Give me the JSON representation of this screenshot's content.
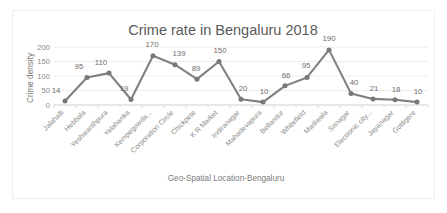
{
  "chart_data": {
    "type": "line",
    "title": "Crime rate in Bengaluru 2018",
    "xlabel": "Geo-Spatial Location-Bengaluru",
    "ylabel": "Crime density",
    "categories": [
      "Jalahalli",
      "Hebbala",
      "Yeshwanthpura",
      "Yelahanka",
      "Kempegowda...",
      "Corporation Circle",
      "Chickpete",
      "K R Market",
      "Indiranagar",
      "Mahadevapura",
      "Bellandur",
      "Whitefield",
      "Madiwala",
      "Srinagar",
      "Electronic city...",
      "Jayanagar",
      "Gottigere"
    ],
    "values": [
      14,
      95,
      110,
      19,
      170,
      139,
      89,
      150,
      20,
      10,
      66,
      95,
      190,
      40,
      21,
      18,
      10
    ],
    "data_labels": [
      "14",
      "95",
      "110",
      "19",
      "170",
      "139",
      "89",
      "150",
      "20",
      "10",
      "66",
      "95",
      "190",
      "40",
      "21",
      "18",
      "10"
    ],
    "ytick_labels": [
      "0",
      "50",
      "100",
      "150",
      "200"
    ],
    "ytick_values": [
      0,
      50,
      100,
      150,
      200
    ],
    "ylim": [
      0,
      200
    ],
    "grid": true,
    "legend": false,
    "series_color": "#808080",
    "marker": "circle",
    "marker_color": "#787878"
  },
  "styles": {
    "title_color": "#5a5a5a",
    "axis_color": "#8a8a8a",
    "grid_color": "#e8e8e8",
    "border_color": "#eceff1"
  }
}
